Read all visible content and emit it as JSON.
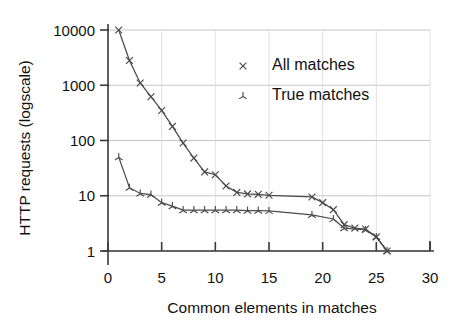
{
  "chart_data": {
    "type": "line",
    "title": "",
    "xlabel": "Common elements in matches",
    "ylabel": "HTTP requests (logscale)",
    "yscale": "log",
    "xlim": [
      0,
      30
    ],
    "ylim": [
      1,
      10000
    ],
    "grid": true,
    "legend_position": "upper-center-right",
    "xticks": [
      "0",
      "5",
      "10",
      "15",
      "20",
      "25",
      "30"
    ],
    "xtick_values": [
      0,
      5,
      10,
      15,
      20,
      25,
      30
    ],
    "yticks": [
      "10000",
      "1000",
      "100",
      "10",
      "1"
    ],
    "ytick_values": [
      10000,
      1000,
      100,
      10,
      1
    ],
    "series": [
      {
        "name": "All matches",
        "marker": "cross-x",
        "x": [
          1,
          2,
          3,
          4,
          5,
          6,
          7,
          8,
          9,
          10,
          11,
          12,
          13,
          14,
          15,
          19,
          20,
          21,
          22,
          23,
          24,
          25,
          26
        ],
        "values": [
          10000,
          2800,
          1100,
          620,
          350,
          180,
          90,
          48,
          27,
          24,
          15,
          11.5,
          10.8,
          10.6,
          10.2,
          9.5,
          7.5,
          5.6,
          3.0,
          2.6,
          2.5,
          1.8,
          1.0
        ]
      },
      {
        "name": "True matches",
        "marker": "tri-star",
        "x": [
          1,
          2,
          3,
          4,
          5,
          6,
          7,
          8,
          9,
          10,
          11,
          12,
          13,
          14,
          15,
          19,
          21,
          22,
          24,
          25,
          26
        ],
        "values": [
          50,
          14,
          11,
          10.5,
          7.5,
          6.5,
          5.5,
          5.5,
          5.5,
          5.5,
          5.5,
          5.5,
          5.4,
          5.4,
          5.3,
          4.5,
          3.8,
          2.6,
          2.4,
          1.8,
          1.0
        ]
      }
    ]
  },
  "legend": {
    "items": [
      {
        "label": "All matches",
        "marker": "cross-x"
      },
      {
        "label": "True matches",
        "marker": "tri-star"
      }
    ]
  },
  "colors": {
    "ink": "#1a1a1a",
    "series": "#4a4a4a",
    "grid_major": "#b9b9b9",
    "grid_minor": "#d8d8d8",
    "background": "#ffffff"
  }
}
